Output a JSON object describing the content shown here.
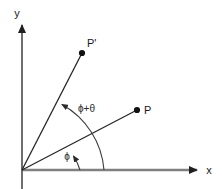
{
  "figure": {
    "type": "geometry-diagram",
    "background_color": "#ffffff",
    "width": 222,
    "height": 189
  },
  "colors": {
    "axis": "#808080",
    "ray": "#262626",
    "arc": "#4d4d4d",
    "point": "#111111",
    "text": "#1a1a1a"
  },
  "axes": {
    "origin": {
      "x": 22,
      "y": 170
    },
    "x_axis": {
      "label": "x",
      "label_pos": {
        "x": 209,
        "y": 174
      },
      "from": {
        "x": 22,
        "y": 170
      },
      "to": {
        "x": 199,
        "y": 170
      }
    },
    "y_axis": {
      "label": "y",
      "label_pos": {
        "x": 17,
        "y": 17
      },
      "from": {
        "x": 22,
        "y": 189
      },
      "to": {
        "x": 22,
        "y": 22
      }
    }
  },
  "points": [
    {
      "id": "P",
      "label": "P",
      "position": {
        "x": 137,
        "y": 110
      },
      "label_pos": {
        "x": 144,
        "y": 111
      },
      "ray_from": {
        "x": 22,
        "y": 170
      },
      "angle_deg": 27.5
    },
    {
      "id": "Pprime",
      "label": "P'",
      "position": {
        "x": 82,
        "y": 53
      },
      "label_pos": {
        "x": 87,
        "y": 47
      },
      "ray_from": {
        "x": 22,
        "y": 170
      },
      "angle_deg": 62.8
    }
  ],
  "angles": [
    {
      "id": "phi",
      "label": "ϕ",
      "label_pos": {
        "x": 67,
        "y": 159
      },
      "radius": 58,
      "start_deg": 0,
      "end_deg": 27.5,
      "arrow_at": "end",
      "description": "angle from x-axis to ray OP"
    },
    {
      "id": "phi-plus-theta",
      "label": "ϕ+θ",
      "label_pos": {
        "x": 78,
        "y": 112
      },
      "radius": 82,
      "start_deg": 0,
      "end_deg": 62.8,
      "arrow_at": "end",
      "description": "angle from x-axis to ray OP'"
    }
  ]
}
